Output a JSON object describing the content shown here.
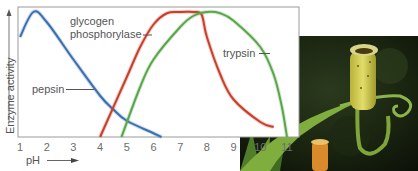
{
  "chart_data": {
    "type": "line",
    "title": "",
    "xlabel": "pH",
    "ylabel": "Enzyme activity",
    "xlim": [
      1,
      11
    ],
    "ylim": [
      0,
      100
    ],
    "grid": false,
    "legend": "inline labels",
    "x_ticks": [
      "1",
      "2",
      "3",
      "4",
      "5",
      "6",
      "7",
      "8",
      "9",
      "10",
      "11"
    ],
    "series": [
      {
        "name": "pepsin",
        "color": "#3a6fb0",
        "points": [
          [
            1,
            80
          ],
          [
            1.5,
            100
          ],
          [
            2,
            92
          ],
          [
            3,
            62
          ],
          [
            4,
            33
          ],
          [
            4.5,
            22
          ],
          [
            5,
            13
          ],
          [
            6,
            3
          ],
          [
            6.3,
            0
          ]
        ]
      },
      {
        "name": "glycogen phosphorylase",
        "color": "#c8402a",
        "points": [
          [
            4,
            0
          ],
          [
            5,
            48
          ],
          [
            5.5,
            72
          ],
          [
            6,
            90
          ],
          [
            6.5,
            99
          ],
          [
            7,
            100
          ],
          [
            7.5,
            100
          ],
          [
            7.8,
            98
          ],
          [
            8,
            80
          ],
          [
            8.5,
            50
          ],
          [
            9,
            30
          ],
          [
            10,
            12
          ],
          [
            10.5,
            8
          ]
        ]
      },
      {
        "name": "trypsin",
        "color": "#5aa64a",
        "points": [
          [
            4.8,
            0
          ],
          [
            5.5,
            40
          ],
          [
            6,
            62
          ],
          [
            7,
            88
          ],
          [
            7.5,
            97
          ],
          [
            8,
            100
          ],
          [
            8.5,
            99
          ],
          [
            9,
            93
          ],
          [
            10,
            72
          ],
          [
            10.5,
            50
          ],
          [
            10.8,
            25
          ],
          [
            11,
            0
          ]
        ]
      }
    ]
  },
  "labels": {
    "pepsin": "pepsin",
    "glycogen_line1": "glycogen",
    "glycogen_line2": "phosphorylase",
    "trypsin": "trypsin",
    "y_axis": "Enzyme activity",
    "x_axis": "pH"
  },
  "photo": {
    "subject": "pitcher-plant-photo"
  }
}
